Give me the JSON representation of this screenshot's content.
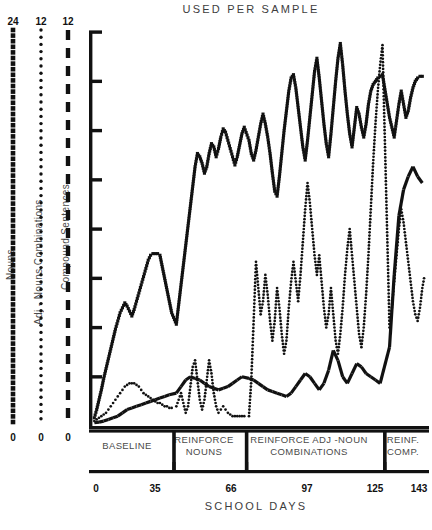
{
  "chart": {
    "title": "USED PER SAMPLE",
    "xlabel": "SCHOOL DAYS",
    "type": "line"
  },
  "legend": {
    "series": [
      {
        "name": "Nouns",
        "top": "24",
        "bottom": "0",
        "marker": "square",
        "scale_max": 24
      },
      {
        "name": "Adj - Nouns Combinations",
        "top": "12",
        "bottom": "0",
        "marker": "dot",
        "scale_max": 12
      },
      {
        "name": "Compound  Sentences",
        "top": "12",
        "bottom": "0",
        "marker": "dash",
        "scale_max": 12
      }
    ]
  },
  "xaxis": {
    "ticks": [
      "0",
      "35",
      "66",
      "97",
      "125",
      "143"
    ],
    "min": 0,
    "max": 143
  },
  "phases": [
    {
      "label": "BASELINE",
      "start": 0,
      "end": 35
    },
    {
      "label": "REINFORCE\nNOUNS",
      "line1": "REINFORCE",
      "line2": "NOUNS",
      "start": 35,
      "end": 66
    },
    {
      "label": "REINFORCE ADJ -NOUN\nCOMBINATIONS",
      "line1": "REINFORCE ADJ -NOUN",
      "line2": "COMBINATIONS",
      "start": 66,
      "end": 125
    },
    {
      "label": "REINF.\nCOMP.",
      "line1": "REINF.",
      "line2": "COMP.",
      "start": 125,
      "end": 143
    }
  ],
  "chart_data": {
    "type": "line",
    "title": "USED PER SAMPLE",
    "xlabel": "SCHOOL DAYS",
    "ylabel": "",
    "xlim": [
      0,
      143
    ],
    "grid": false,
    "legend_position": "left-vertical-scales",
    "xticks": [
      0,
      35,
      66,
      97,
      125,
      143
    ],
    "phase_dividers": [
      35,
      66,
      125
    ],
    "phase_labels": [
      "BASELINE",
      "REINFORCE NOUNS",
      "REINFORCE ADJ -NOUN COMBINATIONS",
      "REINF. COMP."
    ],
    "yticks_count": 8,
    "series": [
      {
        "name": "Nouns",
        "marker": "square",
        "scale_max": 24,
        "ylim": [
          0,
          24
        ],
        "x": [
          1,
          2,
          3,
          4,
          5,
          6,
          7,
          8,
          9,
          10,
          11,
          12,
          13,
          14,
          15,
          16,
          17,
          18,
          19,
          20,
          21,
          22,
          23,
          24,
          25,
          26,
          27,
          28,
          29,
          30,
          31,
          32,
          33,
          34,
          36,
          37,
          38,
          39,
          40,
          41,
          42,
          43,
          44,
          45,
          46,
          47,
          48,
          49,
          50,
          51,
          52,
          53,
          54,
          55,
          56,
          57,
          58,
          59,
          60,
          61,
          62,
          63,
          64,
          65,
          67,
          68,
          69,
          70,
          71,
          72,
          73,
          74,
          75,
          76,
          77,
          78,
          79,
          80,
          81,
          82,
          83,
          84,
          85,
          86,
          87,
          88,
          89,
          90,
          91,
          92,
          93,
          94,
          95,
          96,
          97,
          98,
          99,
          100,
          101,
          102,
          103,
          104,
          105,
          106,
          107,
          108,
          109,
          110,
          111,
          112,
          113,
          114,
          115,
          116,
          117,
          118,
          119,
          120,
          121,
          122,
          123,
          124,
          127,
          128,
          129,
          130,
          131,
          132,
          133,
          134,
          135,
          136,
          137,
          138,
          139,
          140,
          141,
          142
        ],
        "values": [
          0.5,
          1.0,
          1.6,
          2.2,
          2.9,
          3.5,
          4.1,
          4.7,
          5.3,
          5.9,
          6.4,
          6.9,
          7.2,
          7.5,
          7.3,
          7.0,
          6.7,
          7.1,
          7.6,
          8.1,
          8.6,
          9.1,
          9.6,
          10.1,
          10.4,
          10.5,
          10.5,
          10.5,
          10.4,
          9.7,
          9.0,
          8.3,
          7.6,
          6.9,
          6.2,
          7.4,
          8.6,
          9.8,
          11.0,
          12.2,
          13.4,
          14.6,
          15.8,
          16.6,
          16.4,
          16.0,
          15.4,
          15.8,
          16.6,
          17.2,
          17.0,
          16.4,
          16.9,
          17.6,
          18.1,
          17.9,
          17.4,
          16.9,
          16.4,
          15.9,
          16.4,
          17.1,
          17.8,
          18.2,
          17.4,
          16.6,
          16.2,
          16.8,
          17.6,
          18.4,
          19.0,
          18.4,
          17.6,
          16.6,
          15.4,
          14.3,
          14.0,
          15.2,
          16.6,
          18.0,
          19.2,
          20.4,
          21.2,
          21.4,
          20.6,
          19.4,
          18.2,
          17.0,
          16.2,
          17.4,
          18.8,
          20.2,
          21.6,
          22.4,
          21.2,
          19.8,
          18.4,
          17.2,
          16.4,
          17.8,
          19.4,
          21.0,
          22.4,
          23.3,
          22.0,
          20.4,
          19.0,
          17.8,
          17.0,
          18.2,
          19.4,
          19.0,
          18.2,
          17.6,
          18.4,
          19.6,
          20.4,
          20.8,
          21.0,
          21.2,
          21.3,
          21.4,
          18.8,
          18.2,
          17.6,
          18.6,
          19.6,
          20.4,
          19.6,
          18.8,
          19.2,
          20.0,
          20.6,
          21.0,
          21.2,
          21.3,
          21.3,
          21.2
        ]
      },
      {
        "name": "Adj - Nouns Combinations",
        "marker": "dot",
        "scale_max": 12,
        "ylim": [
          0,
          12
        ],
        "x": [
          1,
          2,
          3,
          4,
          5,
          6,
          7,
          8,
          9,
          10,
          11,
          12,
          13,
          14,
          15,
          16,
          17,
          18,
          19,
          20,
          21,
          22,
          23,
          24,
          25,
          26,
          27,
          28,
          29,
          30,
          31,
          32,
          33,
          34,
          36,
          37,
          38,
          39,
          40,
          41,
          42,
          43,
          44,
          45,
          46,
          47,
          48,
          49,
          50,
          51,
          52,
          53,
          54,
          55,
          56,
          57,
          58,
          59,
          60,
          61,
          62,
          63,
          64,
          65,
          67,
          68,
          69,
          70,
          71,
          72,
          73,
          74,
          75,
          76,
          77,
          78,
          79,
          80,
          81,
          82,
          83,
          84,
          85,
          86,
          87,
          88,
          89,
          90,
          91,
          92,
          93,
          94,
          95,
          96,
          97,
          98,
          99,
          100,
          101,
          102,
          103,
          104,
          105,
          106,
          107,
          108,
          109,
          110,
          111,
          112,
          113,
          114,
          115,
          116,
          117,
          118,
          119,
          120,
          121,
          122,
          123,
          124,
          127,
          128,
          129,
          130,
          131,
          132,
          133,
          134,
          135,
          136,
          137,
          138,
          139,
          140,
          141,
          142
        ],
        "values": [
          0.15,
          0.2,
          0.25,
          0.3,
          0.35,
          0.4,
          0.5,
          0.6,
          0.7,
          0.8,
          0.9,
          1.0,
          1.1,
          1.2,
          1.25,
          1.3,
          1.3,
          1.3,
          1.25,
          1.2,
          1.1,
          1.0,
          0.95,
          0.9,
          0.85,
          0.8,
          0.75,
          0.7,
          0.7,
          0.65,
          0.6,
          0.6,
          0.55,
          0.55,
          0.6,
          0.8,
          1.0,
          0.7,
          0.4,
          0.6,
          1.2,
          1.8,
          2.0,
          1.4,
          0.8,
          0.5,
          0.8,
          1.4,
          2.0,
          1.6,
          1.0,
          0.6,
          0.4,
          0.5,
          0.6,
          0.5,
          0.4,
          0.35,
          0.3,
          0.3,
          0.3,
          0.3,
          0.3,
          0.3,
          0.3,
          1.4,
          3.2,
          5.0,
          4.2,
          3.4,
          3.8,
          4.6,
          4.0,
          3.2,
          2.6,
          3.2,
          4.2,
          3.6,
          2.8,
          2.2,
          2.6,
          3.6,
          4.4,
          5.0,
          4.4,
          3.8,
          4.6,
          5.6,
          6.6,
          7.4,
          6.8,
          6.0,
          5.2,
          4.6,
          5.2,
          4.4,
          3.6,
          3.0,
          3.4,
          4.2,
          3.4,
          2.6,
          2.2,
          2.8,
          3.6,
          4.6,
          5.4,
          6.0,
          5.2,
          4.4,
          3.6,
          2.8,
          2.4,
          3.0,
          4.0,
          5.2,
          6.6,
          8.0,
          9.2,
          10.2,
          11.0,
          11.6,
          3.0,
          3.6,
          4.4,
          5.2,
          6.0,
          6.6,
          6.2,
          5.6,
          5.0,
          4.4,
          3.8,
          3.4,
          3.2,
          3.6,
          4.2,
          4.6
        ]
      },
      {
        "name": "Compound  Sentences",
        "marker": "dash",
        "scale_max": 12,
        "ylim": [
          0,
          12
        ],
        "x": [
          1,
          3,
          5,
          7,
          9,
          11,
          13,
          15,
          17,
          19,
          21,
          23,
          25,
          27,
          29,
          31,
          33,
          36,
          38,
          40,
          42,
          44,
          46,
          48,
          50,
          52,
          54,
          56,
          58,
          60,
          62,
          64,
          67,
          69,
          71,
          73,
          75,
          77,
          79,
          81,
          83,
          85,
          87,
          89,
          91,
          93,
          95,
          97,
          99,
          101,
          103,
          105,
          107,
          109,
          111,
          113,
          115,
          117,
          119,
          121,
          123,
          127,
          129,
          131,
          133,
          135,
          137,
          139,
          141
        ],
        "values": [
          0.1,
          0.12,
          0.15,
          0.2,
          0.25,
          0.3,
          0.4,
          0.5,
          0.55,
          0.6,
          0.65,
          0.7,
          0.75,
          0.8,
          0.85,
          0.9,
          0.95,
          1.0,
          1.2,
          1.4,
          1.5,
          1.45,
          1.4,
          1.3,
          1.2,
          1.15,
          1.1,
          1.15,
          1.2,
          1.3,
          1.4,
          1.5,
          1.45,
          1.4,
          1.3,
          1.2,
          1.1,
          1.05,
          1.0,
          0.95,
          0.9,
          1.0,
          1.2,
          1.4,
          1.6,
          1.5,
          1.3,
          1.1,
          1.3,
          1.7,
          2.3,
          2.0,
          1.5,
          1.3,
          1.6,
          1.9,
          1.8,
          1.6,
          1.5,
          1.4,
          1.3,
          2.4,
          4.6,
          6.4,
          7.2,
          7.6,
          7.9,
          7.6,
          7.4
        ]
      }
    ]
  }
}
